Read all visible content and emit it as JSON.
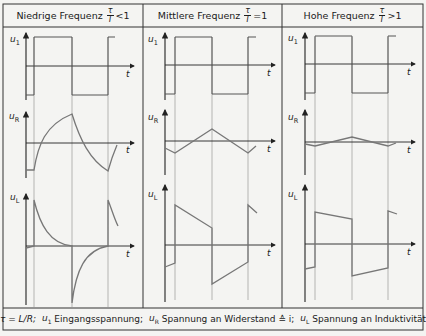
{
  "columns": [
    {
      "title": "Niedrige Frequenz",
      "ratio_num": "τ",
      "ratio_den": "T",
      "relation": "<1"
    },
    {
      "title": "Mittlere Frequenz",
      "ratio_num": "τ",
      "ratio_den": "T",
      "relation": "=1"
    },
    {
      "title": "Hohe Frequenz",
      "ratio_num": "τ",
      "ratio_den": "T",
      "relation": ">1"
    }
  ],
  "rows": [
    {
      "symbol": "u",
      "sub": "1"
    },
    {
      "symbol": "u",
      "sub": "R"
    },
    {
      "symbol": "u",
      "sub": "L"
    }
  ],
  "time_axis_label": "t",
  "footer": {
    "tau_def": "τ = L/R;",
    "u1_desc": "Eingangsspannung;",
    "uR_desc": "Spannung an Widerstand ≙ i;",
    "uL_desc": "Spannung an Induktivität"
  },
  "colors": {
    "line": "#222222",
    "curve": "#707070",
    "border": "#333333",
    "background": "#f4f4f2"
  }
}
